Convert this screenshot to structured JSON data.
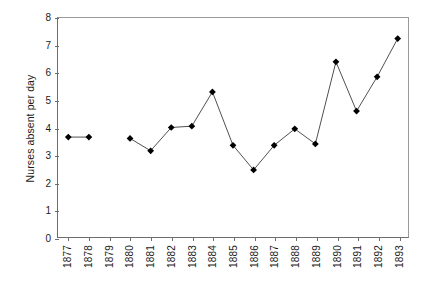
{
  "chart_data": {
    "type": "line",
    "title": "",
    "xlabel": "",
    "ylabel": "Nurses absent per day",
    "ylim": [
      0,
      8
    ],
    "ytick_labels": [
      "8",
      "7",
      "6",
      "5",
      "4",
      "3",
      "2",
      "1",
      "0"
    ],
    "ytick_values": [
      8,
      7,
      6,
      5,
      4,
      3,
      2,
      1,
      0
    ],
    "grid": false,
    "legend": "none",
    "marker": "filled-diamond",
    "line_color": "#3a3a3a",
    "marker_color": "#000000",
    "categories": [
      "1877",
      "1878",
      "1879",
      "1880",
      "1881",
      "1882",
      "1883",
      "1884",
      "1885",
      "1886",
      "1887",
      "1888",
      "1889",
      "1890",
      "1891",
      "1892",
      "1893"
    ],
    "values": [
      3.65,
      3.65,
      null,
      3.6,
      3.15,
      4.0,
      4.05,
      5.3,
      3.35,
      2.45,
      3.35,
      3.95,
      3.4,
      6.4,
      4.6,
      5.85,
      7.25
    ],
    "missing_categories": [
      "1879"
    ]
  }
}
